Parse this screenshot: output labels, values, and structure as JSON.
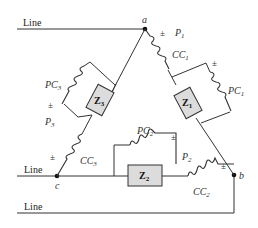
{
  "lines": [
    {
      "id": "line-top",
      "label": "Line"
    },
    {
      "id": "line-mid",
      "label": "Line"
    },
    {
      "id": "line-bottom",
      "label": "Line"
    }
  ],
  "nodes": {
    "a": "a",
    "b": "b",
    "c": "c"
  },
  "impedances": {
    "z1": {
      "main": "Z",
      "sub": "1"
    },
    "z2": {
      "main": "Z",
      "sub": "2"
    },
    "z3": {
      "main": "Z",
      "sub": "3"
    }
  },
  "current_coils": {
    "cc1": {
      "main": "CC",
      "sub": "1"
    },
    "cc2": {
      "main": "CC",
      "sub": "2"
    },
    "cc3": {
      "main": "CC",
      "sub": "3"
    }
  },
  "potential_coils": {
    "pc1": {
      "main": "PC",
      "sub": "1"
    },
    "pc2": {
      "main": "PC",
      "sub": "2"
    },
    "pc3": {
      "main": "PC",
      "sub": "3"
    }
  },
  "wattmeters": {
    "p1": {
      "main": "P",
      "sub": "1"
    },
    "p2": {
      "main": "P",
      "sub": "2"
    },
    "p3": {
      "main": "P",
      "sub": "3"
    }
  },
  "polarity_mark": "±",
  "colors": {
    "wire": "#333333",
    "impedance_fill": "#dcdcdc"
  }
}
